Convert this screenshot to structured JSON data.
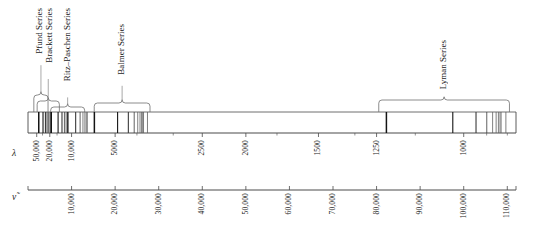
{
  "figure": {
    "axes": {
      "wavelength": {
        "symbol": "λ",
        "name": "wavelength-axis",
        "unit": "angstrom",
        "ticks": [
          {
            "label": "50,000",
            "value": 50000
          },
          {
            "label": "20,000",
            "value": 20000
          },
          {
            "label": "10,000",
            "value": 10000
          },
          {
            "label": "5000",
            "value": 5000
          },
          {
            "label": "2500",
            "value": 2500
          },
          {
            "label": "2000",
            "value": 2000
          },
          {
            "label": "1500",
            "value": 1500
          },
          {
            "label": "1250",
            "value": 1250
          },
          {
            "label": "1000",
            "value": 1000
          }
        ],
        "minor_values": [
          30000,
          15000,
          4000,
          3000,
          1750,
          1333,
          1125,
          950,
          909
        ]
      },
      "wavenumber": {
        "symbol": "ν̃",
        "name": "wavenumber-axis",
        "unit": "cm^-1",
        "ticks": [
          {
            "label": "10,000",
            "value": 10000
          },
          {
            "label": "20,000",
            "value": 20000
          },
          {
            "label": "30,000",
            "value": 30000
          },
          {
            "label": "40,000",
            "value": 40000
          },
          {
            "label": "50,000",
            "value": 50000
          },
          {
            "label": "60,000",
            "value": 60000
          },
          {
            "label": "70,000",
            "value": 70000
          },
          {
            "label": "80,000",
            "value": 80000
          },
          {
            "label": "90,000",
            "value": 90000
          },
          {
            "label": "100,000",
            "value": 100000
          },
          {
            "label": "110,000",
            "value": 110000
          }
        ],
        "range": [
          0,
          112000
        ]
      }
    },
    "series": [
      {
        "name": "Pfund Series",
        "brace_start_wn": 1340,
        "brace_end_wn": 4600,
        "label_anchor_wn": 2700,
        "lines_wn": [
          2469,
          3447,
          4003,
          4350,
          4578,
          4739,
          4857
        ]
      },
      {
        "name": "Brackett Series",
        "brace_start_wn": 2100,
        "brace_end_wn": 7200,
        "label_anchor_wn": 5000,
        "lines_wn": [
          5332,
          6907,
          7801,
          8360,
          8730,
          8988,
          9175
        ]
      },
      {
        "name": "Ritz–Paschen Series",
        "brace_start_wn": 5200,
        "brace_end_wn": 13000,
        "label_anchor_wn": 9100,
        "lines_wn": [
          5332,
          9139,
          10938,
          11959,
          12611,
          13056,
          13374,
          13611
        ]
      },
      {
        "name": "Balmer Series",
        "brace_start_wn": 15200,
        "brace_end_wn": 28000,
        "label_anchor_wn": 21600,
        "lines_wn": [
          15233,
          20565,
          23032,
          24373,
          25181,
          25706,
          26065,
          26322,
          26512,
          27420
        ]
      },
      {
        "name": "Lyman Series",
        "brace_start_wn": 80500,
        "brace_end_wn": 110500,
        "label_anchor_wn": 95500,
        "lines_wn": [
          82259,
          97492,
          102824,
          105292,
          106632,
          107440,
          107965,
          108325,
          108581,
          109678
        ]
      }
    ],
    "colors": {
      "axis": "#4a4a4a",
      "line": "#1c1c1c",
      "brace": "#6e6e6e",
      "text": "#1a1a1a"
    }
  }
}
